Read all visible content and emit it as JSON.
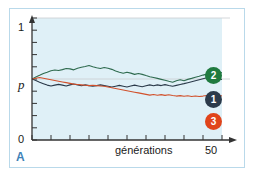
{
  "figure": {
    "panel_label": "A",
    "panel_label_color": "#3f82b8",
    "border_color": "#b9d9ea",
    "plot_background": "#dff0f7"
  },
  "chart_data": {
    "type": "line",
    "title": "",
    "subtitle": "",
    "xlabel": "générations",
    "ylabel": "",
    "xlim": [
      0,
      50
    ],
    "ylim": [
      0,
      1
    ],
    "xticks": [
      0,
      5,
      10,
      15,
      20,
      25,
      30,
      35,
      40,
      45,
      50
    ],
    "xtick_labels": [
      "",
      "",
      "",
      "",
      "",
      "",
      "",
      "",
      "",
      "",
      "50"
    ],
    "yticks": [
      0,
      0.1,
      0.2,
      0.3,
      0.4,
      0.5,
      0.6,
      0.7,
      0.8,
      0.9,
      1
    ],
    "ytick_labels": [
      "0",
      "",
      "",
      "",
      "",
      "p",
      "",
      "",
      "",
      "",
      "1"
    ],
    "grid": true,
    "gridlines_y": [
      0.5,
      1.0
    ],
    "legend_position": "right-inline",
    "start_value": 0.5,
    "x": [
      0,
      1,
      2,
      3,
      4,
      5,
      6,
      7,
      8,
      9,
      10,
      11,
      12,
      13,
      14,
      15,
      16,
      17,
      18,
      19,
      20,
      21,
      22,
      23,
      24,
      25,
      26,
      27,
      28,
      29,
      30,
      31,
      32,
      33,
      34,
      35,
      36,
      37,
      38,
      39,
      40,
      41,
      42,
      43,
      44,
      45,
      46,
      47,
      48,
      49,
      50
    ],
    "series": [
      {
        "name": "2",
        "label": "2",
        "color": "#2f6b4f",
        "badge_color": "#1f7a3f",
        "values": [
          0.5,
          0.516,
          0.53,
          0.545,
          0.556,
          0.568,
          0.574,
          0.569,
          0.577,
          0.586,
          0.583,
          0.575,
          0.588,
          0.596,
          0.603,
          0.611,
          0.601,
          0.592,
          0.586,
          0.594,
          0.588,
          0.579,
          0.566,
          0.556,
          0.547,
          0.556,
          0.548,
          0.538,
          0.545,
          0.538,
          0.528,
          0.519,
          0.512,
          0.505,
          0.497,
          0.489,
          0.481,
          0.474,
          0.486,
          0.494,
          0.486,
          0.497,
          0.505,
          0.514,
          0.522,
          0.532,
          0.54,
          0.548,
          0.556,
          0.545,
          0.552
        ]
      },
      {
        "name": "1",
        "label": "1",
        "color": "#2b3a4a",
        "badge_color": "#2b3a4a",
        "values": [
          0.5,
          0.488,
          0.474,
          0.462,
          0.45,
          0.443,
          0.45,
          0.456,
          0.45,
          0.443,
          0.452,
          0.459,
          0.452,
          0.445,
          0.452,
          0.446,
          0.44,
          0.446,
          0.452,
          0.446,
          0.44,
          0.434,
          0.441,
          0.448,
          0.441,
          0.434,
          0.442,
          0.45,
          0.443,
          0.436,
          0.444,
          0.452,
          0.445,
          0.452,
          0.446,
          0.454,
          0.447,
          0.441,
          0.448,
          0.455,
          0.462,
          0.47,
          0.478,
          0.486,
          0.494,
          0.502,
          0.51,
          0.518,
          0.51,
          0.503,
          0.496
        ]
      },
      {
        "name": "3",
        "label": "3",
        "color": "#d1512c",
        "badge_color": "#e0441b",
        "values": [
          0.5,
          0.506,
          0.512,
          0.506,
          0.5,
          0.494,
          0.488,
          0.482,
          0.476,
          0.47,
          0.464,
          0.458,
          0.455,
          0.452,
          0.449,
          0.446,
          0.449,
          0.446,
          0.443,
          0.44,
          0.434,
          0.428,
          0.422,
          0.416,
          0.41,
          0.404,
          0.398,
          0.392,
          0.386,
          0.38,
          0.374,
          0.368,
          0.373,
          0.367,
          0.372,
          0.366,
          0.371,
          0.365,
          0.36,
          0.364,
          0.358,
          0.363,
          0.357,
          0.361,
          0.356,
          0.36,
          0.365,
          0.36,
          0.364,
          0.359,
          0.363
        ]
      }
    ]
  }
}
